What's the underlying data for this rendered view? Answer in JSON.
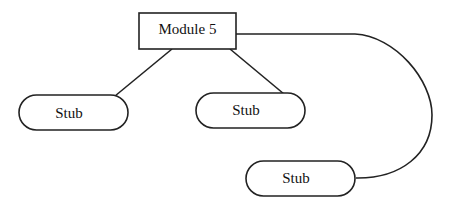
{
  "diagram": {
    "root": {
      "label": "Module 5"
    },
    "stubs": [
      {
        "label": "Stub"
      },
      {
        "label": "Stub"
      },
      {
        "label": "Stub"
      }
    ],
    "stroke_color": "#222222",
    "background": "#ffffff"
  }
}
